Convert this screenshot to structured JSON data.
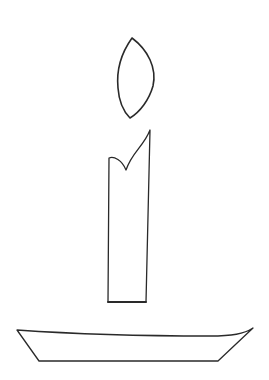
{
  "drawing": {
    "subject": "Candle line drawing",
    "background": "#ffffff",
    "stroke_color": "#2a2a2a",
    "parts": {
      "flame": {
        "name": "flame",
        "stroke_width": 1.6,
        "path": "M132,38 C122,52 116,68 118,88 C119,102 124,112 130,118 C140,112 149,100 153,86 C157,68 148,50 132,38 Z"
      },
      "candle": {
        "name": "candle-body",
        "stroke_width": 1.3,
        "outline_path": "M108,302 L109,158 C114,156 122,160 126,170 C132,152 144,146 150,130 L146,302 Z",
        "notch_path": "M109,158 C114,156 122,160 126,170 C132,152 144,146 150,130",
        "bottom_path": "M108,302 L146,302"
      },
      "holder": {
        "name": "candle-holder-base",
        "stroke_width": 1.3,
        "path": "M17,330 C60,333 140,336 210,336 C232,336 244,334 253,328 L218,361 L39,361 Z"
      }
    }
  }
}
